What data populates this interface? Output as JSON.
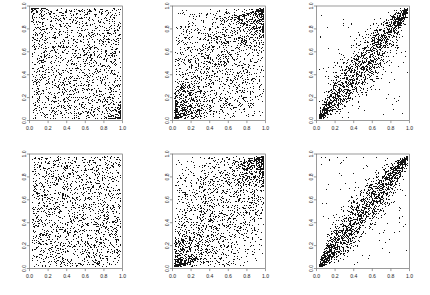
{
  "figure": {
    "name": "scatterplot-matrix",
    "rows": 2,
    "columns": 3,
    "background_color": "#ffffff",
    "point_color": "#141414",
    "axis_color": "#6f6f6f"
  },
  "chart_data": [
    {
      "type": "scatter",
      "title": "",
      "xlabel": "",
      "ylabel": "",
      "xlim": [
        0,
        1
      ],
      "ylim": [
        0,
        1
      ],
      "xticks": [
        "0.0",
        "0.2",
        "0.4",
        "0.6",
        "0.8",
        "1.0"
      ],
      "yticks": [
        "0.0",
        "0.2",
        "0.4",
        "0.6",
        "0.8",
        "1.0"
      ],
      "grid": false,
      "legend": "none",
      "n_points": 2000,
      "dependence": "independent-uniform",
      "correlation": 0.02,
      "tail_density": "slight-corner-clustering",
      "seed": 11
    },
    {
      "type": "scatter",
      "title": "",
      "xlabel": "",
      "ylabel": "",
      "xlim": [
        0,
        1
      ],
      "ylim": [
        0,
        1
      ],
      "xticks": [
        "0.0",
        "0.2",
        "0.4",
        "0.6",
        "0.8",
        "1.0"
      ],
      "yticks": [
        "0.0",
        "0.2",
        "0.4",
        "0.6",
        "0.8",
        "1.0"
      ],
      "grid": false,
      "legend": "none",
      "n_points": 2000,
      "dependence": "weak-positive-tail",
      "correlation": 0.35,
      "tail_density": "strong-lower-left-and-upper-right",
      "seed": 23
    },
    {
      "type": "scatter",
      "title": "",
      "xlabel": "",
      "ylabel": "",
      "xlim": [
        0,
        1
      ],
      "ylim": [
        0,
        1
      ],
      "xticks": [
        "0.0",
        "0.2",
        "0.4",
        "0.6",
        "0.8",
        "1.0"
      ],
      "yticks": [
        "0.0",
        "0.2",
        "0.4",
        "0.6",
        "0.8",
        "1.0"
      ],
      "grid": false,
      "legend": "none",
      "n_points": 2000,
      "dependence": "strong-positive-diagonal",
      "correlation": 0.9,
      "tail_density": "tight-at-both-tails",
      "seed": 37
    },
    {
      "type": "scatter",
      "title": "",
      "xlabel": "",
      "ylabel": "",
      "xlim": [
        0,
        1
      ],
      "ylim": [
        0,
        1
      ],
      "xticks": [
        "0.0",
        "0.2",
        "0.4",
        "0.6",
        "0.8",
        "1.0"
      ],
      "yticks": [
        "0.0",
        "0.2",
        "0.4",
        "0.6",
        "0.8",
        "1.0"
      ],
      "grid": false,
      "legend": "none",
      "n_points": 2000,
      "dependence": "independent-uniform",
      "correlation": 0.0,
      "tail_density": "none",
      "seed": 52
    },
    {
      "type": "scatter",
      "title": "",
      "xlabel": "",
      "ylabel": "",
      "xlim": [
        0,
        1
      ],
      "ylim": [
        0,
        1
      ],
      "xticks": [
        "0.0",
        "0.2",
        "0.4",
        "0.6",
        "0.8",
        "1.0"
      ],
      "yticks": [
        "0.0",
        "0.2",
        "0.4",
        "0.6",
        "0.8",
        "1.0"
      ],
      "grid": false,
      "legend": "none",
      "n_points": 2000,
      "dependence": "weak-positive-tail",
      "correlation": 0.35,
      "tail_density": "strong-lower-left-and-upper-right",
      "seed": 64
    },
    {
      "type": "scatter",
      "title": "",
      "xlabel": "",
      "ylabel": "",
      "xlim": [
        0,
        1
      ],
      "ylim": [
        0,
        1
      ],
      "xticks": [
        "0.0",
        "0.2",
        "0.4",
        "0.6",
        "0.8",
        "1.0"
      ],
      "yticks": [
        "0.0",
        "0.2",
        "0.4",
        "0.6",
        "0.8",
        "1.0"
      ],
      "grid": false,
      "legend": "none",
      "n_points": 2000,
      "dependence": "strong-positive-diagonal",
      "correlation": 0.92,
      "tail_density": "tight-at-both-tails",
      "seed": 78
    }
  ]
}
